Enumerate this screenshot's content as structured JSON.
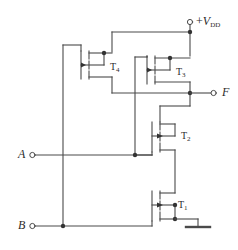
{
  "diagram": {
    "kind": "circuit-schematic",
    "stroke_color": "#4a4a4a",
    "text_color": "#2b2b2b",
    "background": "#ffffff"
  },
  "terminals": {
    "supply": {
      "plus": "+",
      "symbol": "V",
      "subscript": "DD",
      "full_label": "+VDD"
    },
    "output": {
      "label": "F"
    },
    "input_a": {
      "label": "A"
    },
    "input_b": {
      "label": "B"
    },
    "ground": {
      "label": ""
    }
  },
  "devices": [
    {
      "id": "T4",
      "name": "T",
      "subscript": "4",
      "type": "pmos"
    },
    {
      "id": "T3",
      "name": "T",
      "subscript": "3",
      "type": "pmos"
    },
    {
      "id": "T2",
      "name": "T",
      "subscript": "2",
      "type": "nmos"
    },
    {
      "id": "T1",
      "name": "T",
      "subscript": "1",
      "type": "nmos"
    }
  ]
}
